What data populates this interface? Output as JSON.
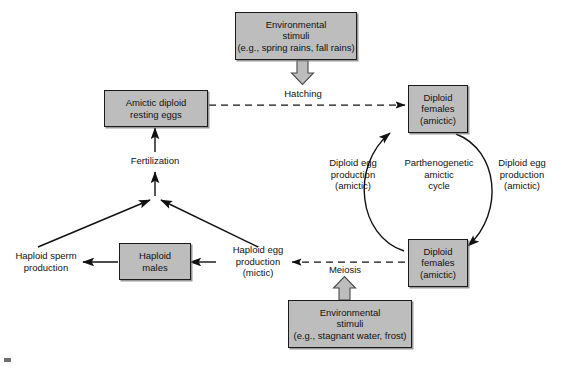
{
  "diagram": {
    "background_color": "#ffffff",
    "box_fill_color": "#bdbdbd",
    "box_border_color": "#1a1a1a",
    "line_color": "#111111",
    "fat_arrow_fill": "#bdbdbd",
    "nodes": {
      "env_top": {
        "line1": "Environmental",
        "line2": "stimuli",
        "line3": "(e.g., spring rains, fall rains)"
      },
      "resting_eggs": {
        "line1": "Amictic diploid",
        "line2": "resting eggs"
      },
      "diploid_females_top": {
        "line1": "Diploid",
        "line2": "females",
        "line3": "(amictic)"
      },
      "diploid_females_bottom": {
        "line1": "Diploid",
        "line2": "females",
        "line3": "(amictic)"
      },
      "haploid_males": {
        "line1": "Haploid",
        "line2": "males"
      },
      "env_bottom": {
        "line1": "Environmental",
        "line2": "stimuli",
        "line3": "(e.g., stagnant water, frost)"
      }
    },
    "labels": {
      "hatching": "Hatching",
      "fertilization": "Fertilization",
      "meiosis": "Meiosis",
      "cycle_center": {
        "line1": "Parthenogenetic",
        "line2": "amictic",
        "line3": "cycle"
      },
      "diploid_egg_left": {
        "line1": "Diploid egg",
        "line2": "production",
        "line3": "(amictic)"
      },
      "diploid_egg_right": {
        "line1": "Diploid egg",
        "line2": "production",
        "line3": "(amictic)"
      },
      "haploid_sperm": {
        "line1": "Haploid sperm",
        "line2": "production"
      },
      "haploid_egg": {
        "line1": "Haploid egg",
        "line2": "production",
        "line3": "(mictic)"
      }
    }
  }
}
